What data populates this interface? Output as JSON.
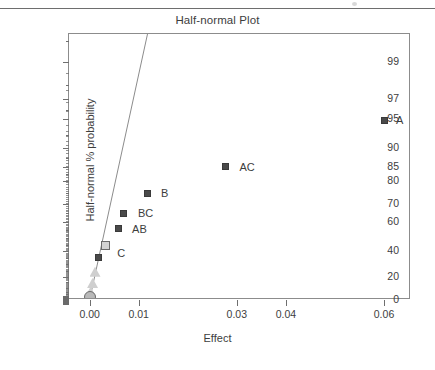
{
  "chart_data": {
    "type": "scatter",
    "title": "Half-normal Plot",
    "xlabel": "Effect",
    "ylabel": "Half-normal % probability",
    "grid": false,
    "legend": "none",
    "xlim": [
      -0.0042,
      0.0655
    ],
    "ylim_prob": [
      0,
      99.6
    ],
    "x_ticks": [
      {
        "value": 0.0,
        "label": "0.00"
      },
      {
        "value": 0.01,
        "label": "0.01"
      },
      {
        "value": 0.03,
        "label": "0.03"
      },
      {
        "value": 0.04,
        "label": "0.04"
      },
      {
        "value": 0.06,
        "label": "0.06"
      }
    ],
    "y_ticks_major": [
      {
        "value": 0,
        "label": "0"
      },
      {
        "value": 20,
        "label": "20"
      },
      {
        "value": 40,
        "label": "40"
      },
      {
        "value": 60,
        "label": "60"
      },
      {
        "value": 70,
        "label": "70"
      },
      {
        "value": 80,
        "label": "80"
      },
      {
        "value": 85,
        "label": "85"
      },
      {
        "value": 90,
        "label": "90"
      },
      {
        "value": 95,
        "label": "95"
      },
      {
        "value": 97,
        "label": "97"
      },
      {
        "value": 99,
        "label": "99"
      }
    ],
    "y_ticks_minor": [
      1,
      2,
      3,
      5,
      7,
      10,
      15,
      25,
      30,
      35,
      45,
      50,
      55,
      65,
      75,
      82.5,
      87.5,
      92.5,
      96,
      98,
      99.5
    ],
    "reference_line": {
      "x_start": 0.0,
      "y_start": 0.0,
      "x_end": 0.0118,
      "y_end": 99.6,
      "color": "#8c8c8c"
    },
    "points": [
      {
        "label": "A",
        "x": 0.06,
        "y": 94.8,
        "marker": "square",
        "color": "#4a4a4a",
        "label_dx": 12,
        "label_dy": -5
      },
      {
        "label": "AC",
        "x": 0.0277,
        "y": 85.0,
        "marker": "square",
        "color": "#4a4a4a",
        "label_dx": 14,
        "label_dy": -5
      },
      {
        "label": "B",
        "x": 0.0117,
        "y": 75.0,
        "marker": "square",
        "color": "#4a4a4a",
        "label_dx": 14,
        "label_dy": -5
      },
      {
        "label": "BC",
        "x": 0.007,
        "y": 65.0,
        "marker": "square",
        "color": "#4a4a4a",
        "label_dx": 14,
        "label_dy": -5
      },
      {
        "label": "AB",
        "x": 0.0058,
        "y": 56.0,
        "marker": "square",
        "color": "#4a4a4a",
        "label_dx": 14,
        "label_dy": -5
      },
      {
        "label": "C",
        "x": 0.0032,
        "y": 44.5,
        "marker": "square-open",
        "color": "#d2d2d2",
        "label_dx": 12,
        "label_dy": 3
      },
      {
        "label": "",
        "x": 0.0018,
        "y": 35.0,
        "marker": "square",
        "color": "#4a4a4a",
        "label_dx": 0,
        "label_dy": 0
      },
      {
        "label": "",
        "x": 0.0011,
        "y": 24.0,
        "marker": "triangle",
        "color": "#cfcfcf",
        "label_dx": 0,
        "label_dy": 0
      },
      {
        "label": "",
        "x": 0.0006,
        "y": 14.5,
        "marker": "triangle",
        "color": "#cfcfcf",
        "label_dx": 0,
        "label_dy": 0
      },
      {
        "label": "",
        "x": 0.0002,
        "y": 7.0,
        "marker": "triangle",
        "color": "#cfcfcf",
        "label_dx": 0,
        "label_dy": 0
      },
      {
        "label": "",
        "x": 0.0001,
        "y": 3.0,
        "marker": "circle",
        "color": "#b9b9b9",
        "label_dx": 0,
        "label_dy": 0
      }
    ],
    "axis_origin_markers": [
      {
        "y": 0.0,
        "note": "zero-row marker block at left axis"
      }
    ]
  }
}
